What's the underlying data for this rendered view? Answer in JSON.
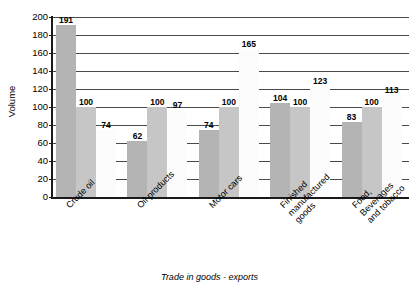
{
  "chart_data": {
    "type": "bar",
    "title": "",
    "xlabel": "Trade in goods - exports",
    "ylabel": "Volume",
    "ylim": [
      0,
      200
    ],
    "ytick_step": 20,
    "yticks": [
      200,
      180,
      160,
      140,
      120,
      100,
      80,
      60,
      40,
      20,
      0
    ],
    "grid": true,
    "legend": "none",
    "categories": [
      "Crude oil",
      "Oil products",
      "Motor cars",
      "Finished manufactured goods",
      "Food, Beverages and tobacco"
    ],
    "series": [
      {
        "name": "series-1",
        "color": "#b4b4b4",
        "values": [
          191,
          62,
          74,
          104,
          83
        ]
      },
      {
        "name": "series-2",
        "color": "#c6c6c6",
        "values": [
          100,
          100,
          100,
          100,
          100
        ]
      },
      {
        "name": "series-3",
        "color": "#fcfcfc",
        "values": [
          74,
          97,
          165,
          123,
          113
        ]
      }
    ]
  },
  "axes": {
    "y_title": "Volume",
    "x_title": "Trade in goods - exports",
    "y_ticks": [
      "200",
      "180",
      "160",
      "140",
      "120",
      "100",
      "80",
      "60",
      "40",
      "20",
      "0"
    ]
  },
  "categories": [
    {
      "label": "Crude oil",
      "lines": [
        "Crude oil"
      ]
    },
    {
      "label": "Oil products",
      "lines": [
        "Oil products"
      ]
    },
    {
      "label": "Motor cars",
      "lines": [
        "Motor cars"
      ]
    },
    {
      "label": "Finished manufactured goods",
      "lines": [
        "Finished",
        "manufactured",
        "goods"
      ]
    },
    {
      "label": "Food, Beverages and tobacco",
      "lines": [
        "Food,",
        "Beverages",
        "and tobacco"
      ]
    }
  ],
  "bars": [
    {
      "group": 0,
      "series": 0,
      "value": 191,
      "text": "191",
      "style": "dark"
    },
    {
      "group": 0,
      "series": 1,
      "value": 100,
      "text": "100",
      "style": "mid"
    },
    {
      "group": 0,
      "series": 2,
      "value": 74,
      "text": "74",
      "style": "light"
    },
    {
      "group": 1,
      "series": 0,
      "value": 62,
      "text": "62",
      "style": "dark"
    },
    {
      "group": 1,
      "series": 1,
      "value": 100,
      "text": "100",
      "style": "mid"
    },
    {
      "group": 1,
      "series": 2,
      "value": 97,
      "text": "97",
      "style": "light"
    },
    {
      "group": 2,
      "series": 0,
      "value": 74,
      "text": "74",
      "style": "dark"
    },
    {
      "group": 2,
      "series": 1,
      "value": 100,
      "text": "100",
      "style": "mid"
    },
    {
      "group": 2,
      "series": 2,
      "value": 165,
      "text": "165",
      "style": "light"
    },
    {
      "group": 3,
      "series": 0,
      "value": 104,
      "text": "104",
      "style": "dark"
    },
    {
      "group": 3,
      "series": 1,
      "value": 100,
      "text": "100",
      "style": "mid"
    },
    {
      "group": 3,
      "series": 2,
      "value": 123,
      "text": "123",
      "style": "light"
    },
    {
      "group": 4,
      "series": 0,
      "value": 83,
      "text": "83",
      "style": "dark"
    },
    {
      "group": 4,
      "series": 1,
      "value": 100,
      "text": "100",
      "style": "mid"
    },
    {
      "group": 4,
      "series": 2,
      "value": 113,
      "text": "113",
      "style": "light"
    }
  ],
  "colors": {
    "series_dark": "#b4b4b4",
    "series_mid": "#c6c6c6",
    "series_light": "#fcfcfc",
    "gridline": "#4a4a4a",
    "axis": "#1a1a1a",
    "background": "#ffffff"
  }
}
